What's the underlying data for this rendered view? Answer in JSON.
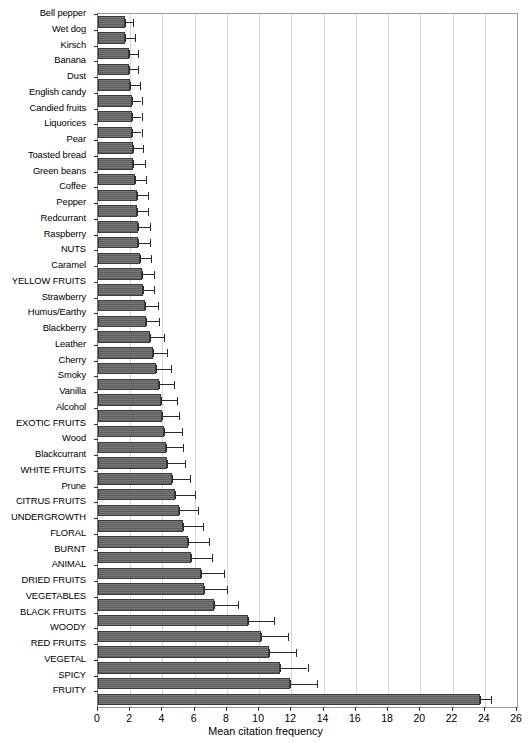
{
  "chart_data": {
    "type": "bar",
    "orientation": "horizontal",
    "title": "",
    "xlabel": "Mean citation frequency",
    "ylabel": "",
    "xlim": [
      0,
      26
    ],
    "xticks": [
      0,
      2,
      4,
      6,
      8,
      10,
      12,
      14,
      16,
      18,
      20,
      22,
      24,
      26
    ],
    "grid": "vertical",
    "legend": "none",
    "error_bars": "yes",
    "categories": [
      "Bell pepper",
      "Wet dog",
      "Kirsch",
      "Banana",
      "Dust",
      "English candy",
      "Candied fruits",
      "Liquorices",
      "Pear",
      "Toasted bread",
      "Green beans",
      "Coffee",
      "Pepper",
      "Redcurrant",
      "Raspberry",
      "NUTS",
      "Caramel",
      "YELLOW FRUITS",
      "Strawberry",
      "Humus/Earthy",
      "Blackberry",
      "Leather",
      "Cherry",
      "Smoky",
      "Vanilla",
      "Alcohol",
      "EXOTIC FRUITS",
      "Wood",
      "Blackcurrant",
      "WHITE FRUITS",
      "Prune",
      "CITRUS FRUITS",
      "UNDERGROWTH",
      "FLORAL",
      "BURNT",
      "ANIMAL",
      "DRIED FRUITS",
      "VEGETABLES",
      "BLACK FRUITS",
      "WOODY",
      "RED FRUITS",
      "VEGETAL",
      "SPICY",
      "FRUITY"
    ],
    "values": [
      1.7,
      1.7,
      1.9,
      1.9,
      2.0,
      2.1,
      2.1,
      2.1,
      2.2,
      2.2,
      2.3,
      2.4,
      2.4,
      2.5,
      2.5,
      2.6,
      2.7,
      2.8,
      2.9,
      3.0,
      3.2,
      3.4,
      3.6,
      3.8,
      3.9,
      4.0,
      4.1,
      4.2,
      4.3,
      4.6,
      4.8,
      5.0,
      5.3,
      5.6,
      5.8,
      6.4,
      6.6,
      7.2,
      9.3,
      10.1,
      10.6,
      11.3,
      11.9,
      23.7
    ],
    "errors_upper": [
      2.2,
      2.3,
      2.5,
      2.5,
      2.6,
      2.7,
      2.7,
      2.7,
      2.8,
      2.9,
      3.0,
      3.1,
      3.1,
      3.2,
      3.2,
      3.3,
      3.5,
      3.5,
      3.7,
      3.8,
      4.1,
      4.3,
      4.5,
      4.7,
      4.9,
      5.0,
      5.2,
      5.3,
      5.4,
      5.7,
      6.0,
      6.2,
      6.5,
      6.9,
      7.1,
      7.8,
      8.0,
      8.7,
      10.9,
      11.8,
      12.3,
      13.0,
      13.6,
      24.4
    ],
    "bar_color": "#5e5e5e",
    "bar_edge_color": "#3b3b3b",
    "grid_color": "#d8d8d8"
  }
}
